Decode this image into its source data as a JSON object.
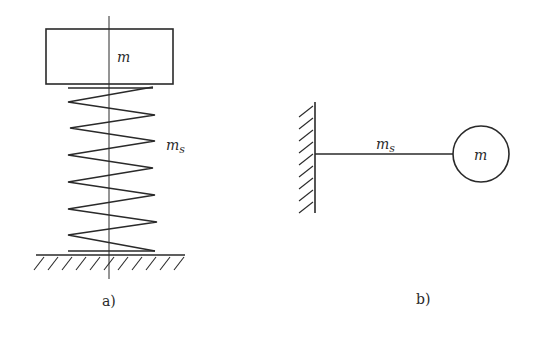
{
  "figure_a": {
    "caption": "a)",
    "mass_label": "m",
    "spring_label_main": "m",
    "spring_label_sub": "s",
    "description": "mass on vertical spring fixed to ground"
  },
  "figure_b": {
    "caption": "b)",
    "mass_label": "m",
    "rod_label_main": "m",
    "rod_label_sub": "s",
    "description": "mass at end of cantilever rod fixed to wall"
  },
  "colors": {
    "stroke": "#2a2a2a",
    "background": "#ffffff"
  }
}
